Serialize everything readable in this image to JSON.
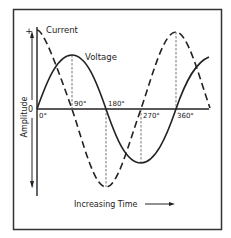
{
  "diagram": {
    "y_axis": {
      "label": "Amplitude",
      "plus_label": "+",
      "zero_label": "0",
      "minus_label": "−"
    },
    "x_axis": {
      "label": "Increasing Time",
      "ticks": [
        "0°",
        "90°",
        "180°",
        "270°",
        "360°"
      ]
    },
    "curves": [
      {
        "name": "Current",
        "style": "dashed",
        "phase": "leads by 90°"
      },
      {
        "name": "Voltage",
        "style": "solid",
        "phase": "reference"
      }
    ],
    "labels": {
      "current": "Current",
      "voltage": "Voltage"
    },
    "colors": {
      "line": "#222222",
      "frame": "#333333",
      "background": "#ffffff"
    }
  }
}
